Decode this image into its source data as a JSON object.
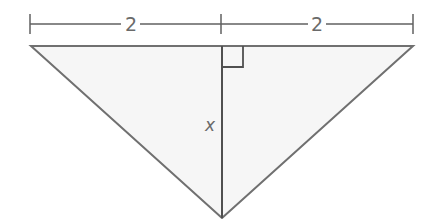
{
  "diagram": {
    "type": "geometry-triangle",
    "dimensions": {
      "left_segment_label": "2",
      "right_segment_label": "2"
    },
    "altitude_label": "x",
    "right_angle_marker": true,
    "colors": {
      "stroke": "#707070",
      "fill": "#f6f6f6",
      "text": "#6a6a6a"
    }
  }
}
